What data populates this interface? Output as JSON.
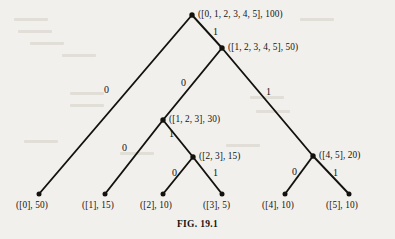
{
  "figure": {
    "caption": "FIG. 19.1",
    "ink_color": "#14120f",
    "page_color": "#f2f0ec"
  },
  "chart_data": {
    "type": "diagram",
    "diagram_type": "binary-code-tree",
    "title": "FIG. 19.1",
    "nodes": [
      {
        "id": "n0",
        "label": "([0, 1, 2, 3, 4, 5], 100)",
        "set": "[0, 1, 2, 3, 4, 5]",
        "weight": 100,
        "x": 192,
        "y": 15,
        "label_x": 198,
        "label_y": 9,
        "kind": "internal"
      },
      {
        "id": "n1",
        "label": "([1, 2, 3, 4, 5], 50)",
        "set": "[1, 2, 3, 4, 5]",
        "weight": 50,
        "x": 222,
        "y": 48,
        "label_x": 228,
        "label_y": 42,
        "kind": "internal"
      },
      {
        "id": "n2",
        "label": "([1, 2, 3], 30)",
        "set": "[1, 2, 3]",
        "weight": 30,
        "x": 163,
        "y": 120,
        "label_x": 169,
        "label_y": 114,
        "kind": "internal"
      },
      {
        "id": "n3",
        "label": "([2, 3], 15)",
        "set": "[2, 3]",
        "weight": 15,
        "x": 193,
        "y": 157,
        "label_x": 199,
        "label_y": 151,
        "kind": "internal"
      },
      {
        "id": "n4",
        "label": "([4, 5], 20)",
        "set": "[4, 5]",
        "weight": 20,
        "x": 313,
        "y": 156,
        "label_x": 319,
        "label_y": 150,
        "kind": "internal"
      },
      {
        "id": "l0",
        "label": "([0], 50)",
        "set": "[0]",
        "weight": 50,
        "x": 39,
        "y": 194,
        "label_x": 16,
        "label_y": 200,
        "kind": "leaf"
      },
      {
        "id": "l1",
        "label": "([1], 15)",
        "set": "[1]",
        "weight": 15,
        "x": 105,
        "y": 194,
        "label_x": 82,
        "label_y": 200,
        "kind": "leaf"
      },
      {
        "id": "l2",
        "label": "([2], 10)",
        "set": "[2]",
        "weight": 10,
        "x": 163,
        "y": 194,
        "label_x": 140,
        "label_y": 200,
        "kind": "leaf"
      },
      {
        "id": "l3",
        "label": "([3], 5)",
        "set": "[3]",
        "weight": 5,
        "x": 222,
        "y": 194,
        "label_x": 203,
        "label_y": 200,
        "kind": "leaf"
      },
      {
        "id": "l4",
        "label": "([4], 10)",
        "set": "[4]",
        "weight": 10,
        "x": 285,
        "y": 194,
        "label_x": 262,
        "label_y": 200,
        "kind": "leaf"
      },
      {
        "id": "l5",
        "label": "([5], 10)",
        "set": "[5]",
        "weight": 10,
        "x": 349,
        "y": 194,
        "label_x": 326,
        "label_y": 200,
        "kind": "leaf"
      }
    ],
    "edges": [
      {
        "from": "n0",
        "to": "l0",
        "bit": "0",
        "bit_x": 104,
        "bit_y": 84
      },
      {
        "from": "n0",
        "to": "n1",
        "bit": "1",
        "bit_x": 213,
        "bit_y": 26
      },
      {
        "from": "n1",
        "to": "n2",
        "bit": "0",
        "bit_x": 181,
        "bit_y": 77
      },
      {
        "from": "n1",
        "to": "n4",
        "bit": "1",
        "bit_x": 266,
        "bit_y": 86
      },
      {
        "from": "n2",
        "to": "l1",
        "bit": "0",
        "bit_x": 122,
        "bit_y": 142
      },
      {
        "from": "n2",
        "to": "n3",
        "bit": "1",
        "bit_x": 169,
        "bit_y": 128
      },
      {
        "from": "n3",
        "to": "l2",
        "bit": "0",
        "bit_x": 172,
        "bit_y": 167
      },
      {
        "from": "n3",
        "to": "l3",
        "bit": "1",
        "bit_x": 213,
        "bit_y": 167
      },
      {
        "from": "n4",
        "to": "l4",
        "bit": "0",
        "bit_x": 292,
        "bit_y": 166
      },
      {
        "from": "n4",
        "to": "l5",
        "bit": "1",
        "bit_x": 333,
        "bit_y": 167
      }
    ],
    "axis_ranges": null,
    "grid": false,
    "legend": null
  },
  "background_marks": [
    {
      "text": "",
      "x": 14,
      "y": 18
    },
    {
      "text": "",
      "x": 18,
      "y": 30
    },
    {
      "text": "",
      "x": 30,
      "y": 42
    },
    {
      "text": "",
      "x": 62,
      "y": 54
    },
    {
      "text": "",
      "x": 70,
      "y": 92
    },
    {
      "text": "",
      "x": 70,
      "y": 104
    },
    {
      "text": "",
      "x": 24,
      "y": 140
    },
    {
      "text": "",
      "x": 250,
      "y": 96
    },
    {
      "text": "",
      "x": 256,
      "y": 110
    },
    {
      "text": "",
      "x": 226,
      "y": 144
    },
    {
      "text": "",
      "x": 120,
      "y": 152
    },
    {
      "text": "",
      "x": 300,
      "y": 18
    }
  ]
}
